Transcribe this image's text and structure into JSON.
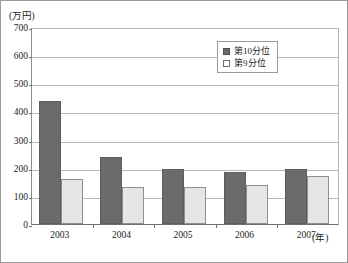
{
  "chart_data": {
    "type": "bar",
    "title": "",
    "xlabel": "(年)",
    "ylabel": "(万円)",
    "categories": [
      "2003",
      "2004",
      "2005",
      "2006",
      "2007"
    ],
    "series": [
      {
        "name": "第10分位",
        "color": "#6b6b6b",
        "values": [
          437,
          237,
          197,
          185,
          195
        ]
      },
      {
        "name": "第9分位",
        "color": "#e6e6e6",
        "values": [
          160,
          133,
          130,
          137,
          172
        ]
      }
    ],
    "ylim": [
      0,
      700
    ],
    "yticks": [
      0,
      100,
      200,
      300,
      400,
      500,
      600,
      700
    ],
    "ytick_labels": [
      "0",
      "100",
      "200",
      "300",
      "400",
      "500",
      "600",
      "700"
    ],
    "grid": true,
    "legend_position": "top-center-right"
  },
  "axes": {
    "unit_label": "(万円)",
    "x_unit_label": "(年)"
  },
  "legend": {
    "items": [
      {
        "label": "第10分位",
        "swatch": "filled-dark-square-icon"
      },
      {
        "label": "第9分位",
        "swatch": "open-light-square-icon"
      }
    ]
  }
}
